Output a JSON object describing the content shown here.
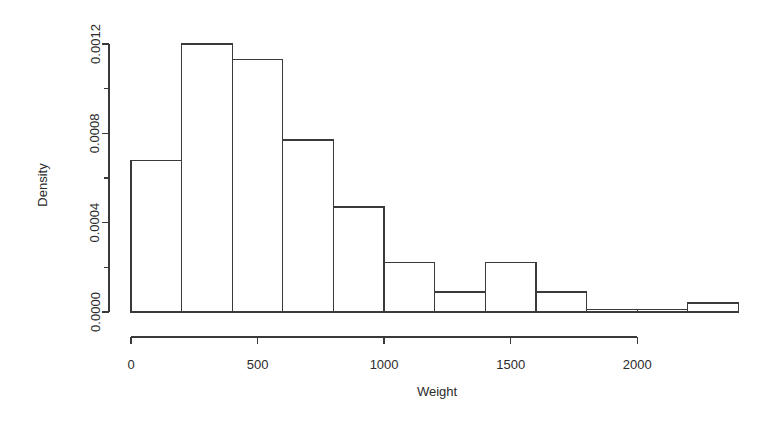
{
  "chart_data": {
    "type": "bar",
    "subtype": "histogram",
    "title": "",
    "xlabel": "Weight",
    "ylabel": "Density",
    "xlim": [
      0,
      2400
    ],
    "ylim": [
      0,
      0.0012
    ],
    "grid": false,
    "legend": null,
    "bin_width": 200,
    "x_ticks": [
      0,
      500,
      1000,
      1500,
      2000
    ],
    "x_tick_labels": [
      "0",
      "500",
      "1000",
      "1500",
      "2000"
    ],
    "x_axis_min_tick": 0,
    "x_axis_max_tick": 2000,
    "y_ticks": [
      0.0,
      0.0002,
      0.0004,
      0.0006,
      0.0008,
      0.001,
      0.0012
    ],
    "y_tick_labels": [
      "0.0000",
      "",
      "0.0004",
      "",
      "0.0008",
      "",
      "0.0012"
    ],
    "bin_edges": [
      0,
      200,
      400,
      600,
      800,
      1000,
      1200,
      1400,
      1600,
      1800,
      2000,
      2200,
      2400
    ],
    "values": [
      0.00068,
      0.0012,
      0.00113,
      0.00077,
      0.00047,
      0.00022,
      9e-05,
      0.00022,
      9e-05,
      1e-05,
      1e-05,
      4e-05
    ],
    "bars": [
      {
        "x0": 0,
        "x1": 200,
        "density": 0.00068
      },
      {
        "x0": 200,
        "x1": 400,
        "density": 0.0012
      },
      {
        "x0": 400,
        "x1": 600,
        "density": 0.00113
      },
      {
        "x0": 600,
        "x1": 800,
        "density": 0.00077
      },
      {
        "x0": 800,
        "x1": 1000,
        "density": 0.00047
      },
      {
        "x0": 1000,
        "x1": 1200,
        "density": 0.00022
      },
      {
        "x0": 1200,
        "x1": 1400,
        "density": 9e-05
      },
      {
        "x0": 1400,
        "x1": 1600,
        "density": 0.00022
      },
      {
        "x0": 1600,
        "x1": 1800,
        "density": 9e-05
      },
      {
        "x0": 1800,
        "x1": 2000,
        "density": 1e-05
      },
      {
        "x0": 2000,
        "x1": 2200,
        "density": 1e-05
      },
      {
        "x0": 2200,
        "x1": 2400,
        "density": 4e-05
      }
    ],
    "colors": {
      "axis": "#3a3a3a",
      "bar_outline": "#3a3a3a",
      "bar_fill": "#ffffff",
      "background": "#ffffff",
      "text": "#2b2b2b"
    }
  }
}
